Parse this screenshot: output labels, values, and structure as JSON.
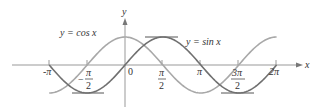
{
  "chart_data": {
    "type": "line",
    "title": "",
    "xlabel": "x",
    "ylabel": "y",
    "xlim": [
      -3.6,
      7.2
    ],
    "ylim": [
      -1.2,
      1.2
    ],
    "x_ticks": [
      "-π",
      "-π/2",
      "0",
      "π/2",
      "π",
      "3π/2",
      "2π"
    ],
    "x_tick_values": [
      -3.14159,
      -1.5708,
      0,
      1.5708,
      3.14159,
      4.71239,
      6.28319
    ],
    "grid": false,
    "series": [
      {
        "name": "y = cos x",
        "function": "cos",
        "x_range": [
          -3.14159,
          6.28319
        ],
        "color": "#a8a8a8",
        "key_points": [
          [
            -3.14159,
            -1
          ],
          [
            -1.5708,
            0
          ],
          [
            0,
            1
          ],
          [
            1.5708,
            0
          ],
          [
            3.14159,
            -1
          ],
          [
            4.71239,
            0
          ],
          [
            6.28319,
            1
          ]
        ]
      },
      {
        "name": "y = sin x",
        "function": "sin",
        "x_range": [
          -3.14159,
          6.28319
        ],
        "color": "#707070",
        "key_points": [
          [
            -3.14159,
            0
          ],
          [
            -1.5708,
            -1
          ],
          [
            0,
            0
          ],
          [
            1.5708,
            1
          ],
          [
            3.14159,
            0
          ],
          [
            4.71239,
            -1
          ],
          [
            6.28319,
            0
          ]
        ]
      }
    ],
    "annotations": [
      "y = cos x",
      "y = sin x"
    ],
    "reference_lines": [
      "y = 1 segment near x = π/2",
      "y = -1 segments near x = -π/2 and x = 3π/2"
    ]
  },
  "labels": {
    "cos_label": "y  =  cos x",
    "sin_label": "y  =  sin x",
    "x_axis": "x",
    "y_axis": "y",
    "origin": "0",
    "neg_pi": "-π",
    "pi": "π",
    "pi_num": "π",
    "two": "2",
    "three_pi": "3π",
    "two_pi": "2π",
    "minus": "−"
  }
}
